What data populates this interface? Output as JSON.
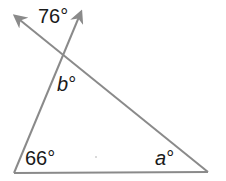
{
  "diagram": {
    "type": "geometry-triangle-exterior-angle",
    "colors": {
      "line": "#8a8a8a",
      "text": "#1a1a1a",
      "background": "#ffffff"
    },
    "angles": {
      "top": {
        "value": "76",
        "unit": "°",
        "text": "76°"
      },
      "inner_b": {
        "var": "b",
        "unit": "°"
      },
      "bottom_left": {
        "value": "66",
        "unit": "°",
        "text": "66°"
      },
      "bottom_right": {
        "var": "a",
        "unit": "°"
      }
    },
    "points": {
      "intersection": [
        63,
        57
      ],
      "bottom_left": [
        14,
        173
      ],
      "bottom_right": [
        208,
        172
      ],
      "arrow_left_tip": [
        13,
        15
      ],
      "arrow_right_tip": [
        82,
        10
      ]
    }
  }
}
